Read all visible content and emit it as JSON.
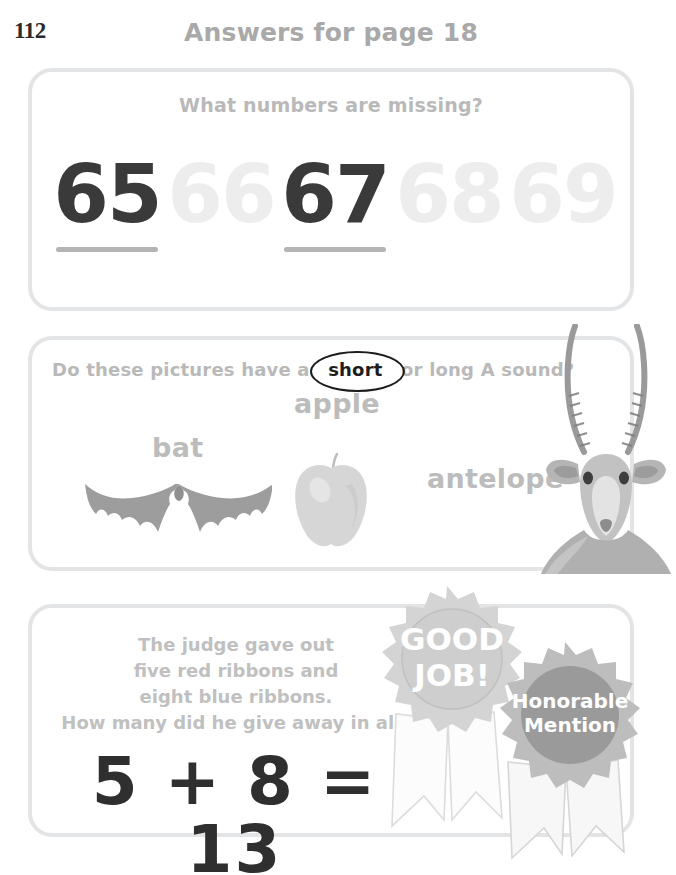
{
  "header": {
    "page_number": "112",
    "title": "Answers for page 18"
  },
  "exercises": [
    {
      "id": "missing-numbers",
      "prompt": "What numbers are missing?",
      "numbers": [
        {
          "value": "65",
          "state": "answer"
        },
        {
          "value": "66",
          "state": "printed"
        },
        {
          "value": "67",
          "state": "answer"
        },
        {
          "value": "68",
          "state": "printed"
        },
        {
          "value": "69",
          "state": "printed"
        }
      ]
    },
    {
      "id": "short-long-a",
      "prompt_before": "Do these pictures have a",
      "prompt_circled": "short",
      "prompt_after": "or long A sound?",
      "picture_words": [
        {
          "label": "bat",
          "image": "bat-illustration"
        },
        {
          "label": "apple",
          "image": "apple-illustration"
        },
        {
          "label": "antelope",
          "image": "antelope-illustration"
        }
      ]
    },
    {
      "id": "ribbons-word-problem",
      "problem_line1": "The judge gave out",
      "problem_line2": "five red ribbons and",
      "problem_line3": "eight blue ribbons.",
      "problem_line4": "How many did he give away in all?",
      "equation": "5 + 8 = 13"
    }
  ],
  "awards": [
    {
      "id": "good-job",
      "line1": "GOOD",
      "line2": "JOB!",
      "color": "#d4d4d4"
    },
    {
      "id": "honorable-mention",
      "line1": "Honorable",
      "line2": "Mention",
      "color": "#9a9a9a"
    }
  ],
  "colors": {
    "box_border": "#e2e4e6",
    "prompt_text": "#b9b9b9",
    "answer_text": "#3a3a3a",
    "faded_number": "#ededed",
    "blank_line": "#b4b4b4"
  }
}
